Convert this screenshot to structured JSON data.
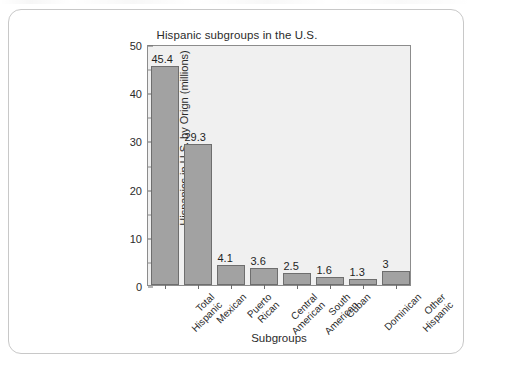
{
  "chart_data": {
    "type": "bar",
    "title": "Hispanic subgroups in the U.S.",
    "xlabel": "Subgroups",
    "ylabel": "Hispanics in U.S. by Orign (millions)",
    "categories": [
      "Total\nHispanic",
      "Mexican",
      "Puerto\nRican",
      "Central\nAmerican",
      "South\nAmerican",
      "Cuban",
      "Dominican",
      "Other\nHispanic"
    ],
    "values": [
      45.4,
      29.3,
      4.1,
      3.6,
      2.5,
      1.6,
      1.3,
      3
    ],
    "value_labels": [
      "45.4",
      "29.3",
      "4.1",
      "3.6",
      "2.5",
      "1.6",
      "1.3",
      "3"
    ],
    "ylim": [
      0,
      50
    ],
    "yticks": [
      0,
      10,
      20,
      30,
      40,
      50
    ],
    "ytick_labels": [
      "0",
      "10",
      "20",
      "30",
      "40",
      "50"
    ],
    "yticks_minor": [
      5,
      15,
      25,
      35,
      45
    ],
    "grid": false,
    "legend": false,
    "bar_color": "#a2a2a2",
    "bar_edge_color": "#6e6e6e",
    "plot_background": "#f0f0f0",
    "axis_color": "#8c8c8c"
  }
}
